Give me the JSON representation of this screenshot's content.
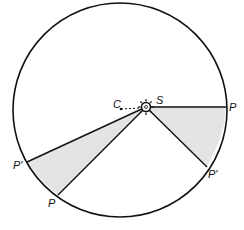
{
  "diagram": {
    "type": "orbit-area-diagram",
    "orbit": {
      "cx": 120,
      "cy": 110,
      "r": 107
    },
    "sun": {
      "cx": 146,
      "cy": 107,
      "r": 5,
      "label": "S"
    },
    "center": {
      "x": 121,
      "y": 109,
      "label": "C"
    },
    "sectors": [
      {
        "name": "right",
        "from": {
          "x": 226,
          "y": 107,
          "label": "P"
        },
        "to": {
          "x": 207,
          "y": 167,
          "label": "P'"
        }
      },
      {
        "name": "left",
        "from": {
          "x": 58,
          "y": 195,
          "label": "P"
        },
        "to": {
          "x": 27,
          "y": 162,
          "label": "P'"
        }
      }
    ],
    "colors": {
      "line": "#111111",
      "shade": "#e4e4e4",
      "background": "#ffffff"
    }
  },
  "labels": {
    "c": "C",
    "s": "S",
    "p_right": "P",
    "p_prime_right": "P'",
    "p_left": "P",
    "p_prime_left": "P'"
  }
}
